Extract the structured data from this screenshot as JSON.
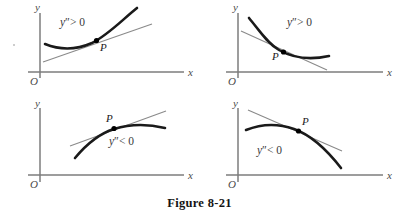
{
  "figure": {
    "caption": "Figure  8-21",
    "background_color": "#ffffff",
    "curve_color": "#1a1a1a",
    "tangent_color": "#8a8a8a",
    "axis_color": "#7d7d7d",
    "point_color": "#000000"
  },
  "panels": [
    {
      "id": "top-left",
      "position": "top-left",
      "condition": "y″ > 0",
      "condition_symbol": "y",
      "condition_prime": "″",
      "condition_relation": "> 0",
      "concavity": "concave-up",
      "slope_at_P": "positive",
      "point_label": "P",
      "point_label_placement": "below-right",
      "x_axis_label": "x",
      "y_axis_label": "y",
      "origin_label": "O",
      "description": "Increasing concave-up curve with tangent line at P lying below the curve"
    },
    {
      "id": "top-right",
      "position": "top-right",
      "condition": "y″ > 0",
      "condition_symbol": "y",
      "condition_prime": "″",
      "condition_relation": "> 0",
      "concavity": "concave-up",
      "slope_at_P": "negative",
      "point_label": "P",
      "point_label_placement": "below-left",
      "x_axis_label": "x",
      "y_axis_label": "y",
      "origin_label": "O",
      "description": "Decreasing concave-up curve with tangent line at P lying below the curve"
    },
    {
      "id": "bottom-left",
      "position": "bottom-left",
      "condition": "y″ < 0",
      "condition_symbol": "y",
      "condition_prime": "″",
      "condition_relation": "< 0",
      "concavity": "concave-down",
      "slope_at_P": "positive",
      "point_label": "P",
      "point_label_placement": "above-left",
      "x_axis_label": "x",
      "y_axis_label": "y",
      "origin_label": "O",
      "description": "Increasing concave-down curve with tangent line at P lying above the curve"
    },
    {
      "id": "bottom-right",
      "position": "bottom-right",
      "condition": "y″ < 0",
      "condition_symbol": "y",
      "condition_prime": "″",
      "condition_relation": "< 0",
      "concavity": "concave-down",
      "slope_at_P": "negative",
      "point_label": "P",
      "point_label_placement": "above-right",
      "x_axis_label": "x",
      "y_axis_label": "y",
      "origin_label": "O",
      "description": "Decreasing concave-down curve with tangent line at P lying above the curve"
    }
  ]
}
